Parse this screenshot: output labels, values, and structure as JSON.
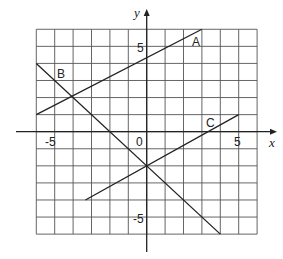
{
  "chart_data": {
    "type": "line",
    "title": "",
    "xlabel": "x",
    "ylabel": "y",
    "xlim": [
      -6,
      6
    ],
    "ylim": [
      -6,
      6
    ],
    "grid": true,
    "x_tick_labels": [
      "-5",
      "0",
      "5"
    ],
    "y_tick_labels": [
      "5",
      "-5"
    ],
    "series": [
      {
        "name": "A",
        "points": [
          [
            -6,
            1
          ],
          [
            3,
            6
          ]
        ],
        "equation": "y = 5/9 x + 13/3"
      },
      {
        "name": "B",
        "points": [
          [
            -6,
            4
          ],
          [
            4,
            -6
          ]
        ],
        "equation": "y = -x - 2"
      },
      {
        "name": "C",
        "points": [
          [
            -3.33,
            -4
          ],
          [
            5,
            1
          ]
        ],
        "equation": "y = 0.6x - 2"
      }
    ],
    "annotations": [
      "A",
      "B",
      "C"
    ]
  },
  "labels": {
    "x_axis": "x",
    "y_axis": "y",
    "tick_neg5_x": "-5",
    "tick_0": "0",
    "tick_5_x": "5",
    "tick_5_y": "5",
    "tick_neg5_y": "-5",
    "line_a": "A",
    "line_b": "B",
    "line_c": "C"
  }
}
